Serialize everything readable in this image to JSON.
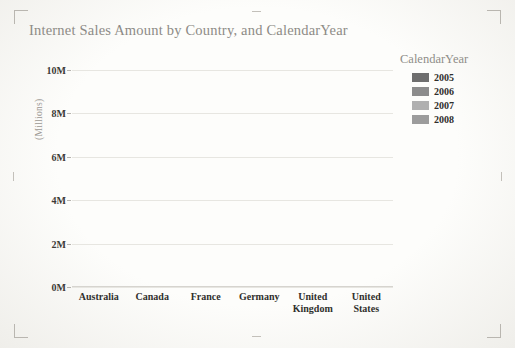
{
  "page": {
    "crop_marks": [
      "top-left",
      "top-right",
      "bottom-left",
      "bottom-right"
    ]
  },
  "legend": {
    "title": "CalendarYear",
    "position": "right"
  },
  "axis": {
    "y_unit_label": "(Millions)"
  },
  "chart_data": {
    "type": "bar",
    "subtype": "stacked-bar",
    "title": "Internet Sales Amount by Country, and CalendarYear",
    "xlabel": "",
    "ylabel": "(Millions)",
    "ylim": [
      0,
      10
    ],
    "yticks": [
      0,
      2,
      4,
      6,
      8,
      10
    ],
    "ytick_labels": [
      "0M",
      "2M",
      "4M",
      "6M",
      "8M",
      "10M"
    ],
    "grid": true,
    "legend_position": "right",
    "legend_title": "CalendarYear",
    "categories": [
      "Australia",
      "Canada",
      "France",
      "Germany",
      "United Kingdom",
      "United States"
    ],
    "category_labels": [
      [
        "Australia"
      ],
      [
        "Canada"
      ],
      [
        "France"
      ],
      [
        "Germany"
      ],
      [
        "United",
        "Kingdom"
      ],
      [
        "United",
        "States"
      ]
    ],
    "series": [
      {
        "name": "2005",
        "color": "#6e6e6e",
        "values": [
          1.3,
          0.05,
          0.1,
          0.1,
          0.15,
          1.2
        ]
      },
      {
        "name": "2006",
        "color": "#8c8c8c",
        "values": [
          2.2,
          0.55,
          0.45,
          0.55,
          0.65,
          2.1
        ]
      },
      {
        "name": "2007",
        "color": "#b0b0b0",
        "values": [
          5.6,
          1.4,
          2.15,
          2.35,
          2.7,
          6.1
        ]
      },
      {
        "name": "2008",
        "color": "#9c9c9c",
        "values": [
          0,
          0,
          0,
          0,
          0,
          0
        ]
      }
    ],
    "totals": [
      9.1,
      2.0,
      2.7,
      3.0,
      3.5,
      9.4
    ]
  }
}
